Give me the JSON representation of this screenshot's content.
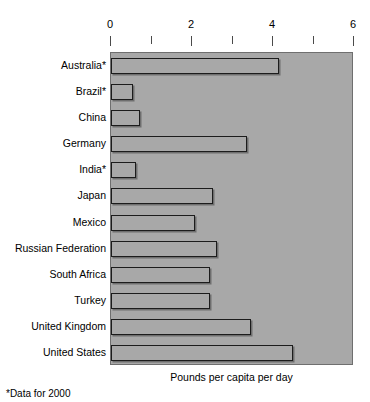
{
  "chart_data": {
    "type": "bar",
    "orientation": "horizontal",
    "title": "",
    "subtitle": "",
    "xlabel": "Pounds per capita per day",
    "ylabel": "",
    "xlim": [
      0,
      6
    ],
    "xticks": [
      0,
      1,
      2,
      3,
      4,
      5,
      6
    ],
    "xtick_labels": [
      "0",
      "",
      "2",
      "",
      "4",
      "",
      "6"
    ],
    "major_ticks": [
      0,
      2,
      4,
      6
    ],
    "minor_ticks": [
      1,
      3,
      5
    ],
    "grid": false,
    "legend": null,
    "categories": [
      "Australia*",
      "Brazil*",
      "China",
      "Germany",
      "India*",
      "Japan",
      "Mexico",
      "Russian Federation",
      "South Africa",
      "Turkey",
      "United Kingdom",
      "United States"
    ],
    "values": [
      4.15,
      0.55,
      0.72,
      3.35,
      0.62,
      2.52,
      2.07,
      2.62,
      2.45,
      2.45,
      3.45,
      4.5
    ],
    "annotations": [
      "*Data for 2000"
    ],
    "colors": {
      "plot_background": "#a8a8a8",
      "bar_fill": "#a8a8a8",
      "bar_edge": "#1c1c1c",
      "axis": "#4a4a4a",
      "text": "#000000",
      "page_background": "#ffffff"
    }
  },
  "footnote": "*Data for 2000",
  "axis_title": "Pounds per capita per day"
}
